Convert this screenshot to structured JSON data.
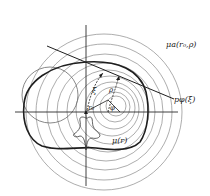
{
  "diagram": {
    "type": "geometric-construction",
    "colors": {
      "background": "#ffffff",
      "thin_line": "#8a8a8a",
      "thick_line": "#1e1e1e",
      "axis": "#2a2a2a",
      "text": "#222222"
    },
    "labels": {
      "outer_family": "μ_a(r_0, ρ)",
      "tangent_line": "p_φ(ξ)",
      "indicatrix": "μ(r)",
      "xi": "ξ",
      "rho": "ρ",
      "phi": "φ",
      "r0": "r_0"
    },
    "label_text": {
      "outer_family": "μa(r₀,ρ)",
      "tangent_line": "pφ(ξ)",
      "indicatrix": "μ(r)",
      "xi": "ξ",
      "rho": "ρ",
      "phi": "φ",
      "r0": "r₀"
    },
    "axes": {
      "origin": [
        86,
        112
      ],
      "horizontal": {
        "x1": 15,
        "x2": 178,
        "y": 112
      },
      "vertical": {
        "x": 86,
        "y1": 25,
        "y2": 186
      }
    },
    "circles": [
      {
        "cx": 104,
        "cy": 112,
        "r": 78
      },
      {
        "cx": 104,
        "cy": 112,
        "r": 68
      },
      {
        "cx": 105,
        "cy": 112,
        "r": 58
      },
      {
        "cx": 106,
        "cy": 112,
        "r": 49
      },
      {
        "cx": 108,
        "cy": 111,
        "r": 41
      },
      {
        "cx": 110,
        "cy": 110,
        "r": 34
      },
      {
        "cx": 112,
        "cy": 109,
        "r": 27
      },
      {
        "cx": 114,
        "cy": 108,
        "r": 21
      },
      {
        "cx": 115,
        "cy": 107,
        "r": 15
      },
      {
        "cx": 116,
        "cy": 106,
        "r": 10
      }
    ],
    "left_circle": {
      "cx": 50,
      "cy": 95,
      "r": 28
    }
  }
}
